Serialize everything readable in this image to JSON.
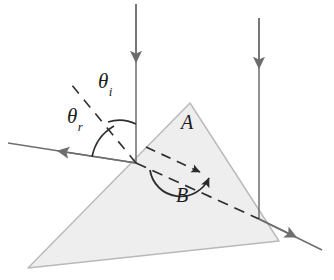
{
  "figure": {
    "background_color": "#ffffff",
    "prism": {
      "name": "triangular prism",
      "fill_color": "#eeeeee",
      "stroke_color": "#b4b4b4",
      "vertices": [
        {
          "label": "apex",
          "x": 190,
          "y": 103
        },
        {
          "label": "bottom-left",
          "x": 28,
          "y": 268
        },
        {
          "label": "bottom-right",
          "x": 279,
          "y": 241
        }
      ]
    },
    "labels": {
      "theta_incident": {
        "symbol": "θ",
        "subscript": "i"
      },
      "theta_refracted": {
        "symbol": "θ",
        "subscript": "r"
      },
      "region_a": "A",
      "region_b": "B"
    },
    "rays": [
      {
        "name": "incident-ray",
        "style": "solid",
        "color": "#6b6b6b",
        "from": {
          "x": 136,
          "y": 4
        },
        "to": {
          "x": 136,
          "y": 163
        },
        "arrowhead_at": {
          "x": 136,
          "y": 62
        },
        "direction": "downward"
      },
      {
        "name": "reflected-ray",
        "style": "solid",
        "color": "#6b6b6b",
        "from": {
          "x": 136,
          "y": 163
        },
        "to": {
          "x": 8,
          "y": 143
        },
        "arrowhead_at": {
          "x": 58,
          "y": 151
        },
        "direction": "up-left"
      },
      {
        "name": "secondary-incident-ray",
        "style": "solid",
        "color": "#6b6b6b",
        "from": {
          "x": 259,
          "y": 18
        },
        "to": {
          "x": 259,
          "y": 219
        },
        "arrowhead_at": {
          "x": 259,
          "y": 66
        },
        "direction": "downward"
      },
      {
        "name": "exit-ray",
        "style": "solid",
        "color": "#6b6b6b",
        "from": {
          "x": 259,
          "y": 219
        },
        "to": {
          "x": 322,
          "y": 250
        },
        "arrowhead_at": {
          "x": 294,
          "y": 236
        },
        "direction": "down-right"
      },
      {
        "name": "refracted-ray-internal",
        "style": "dashed",
        "color": "#2a2a2a",
        "from": {
          "x": 136,
          "y": 163
        },
        "to": {
          "x": 259,
          "y": 219
        }
      },
      {
        "name": "normal-extension-dashed",
        "style": "dashed",
        "color": "#2a2a2a",
        "from": {
          "x": 136,
          "y": 163
        },
        "to": {
          "x": 73,
          "y": 86
        }
      },
      {
        "name": "internal-dashed-upper",
        "style": "dashed",
        "color": "#2a2a2a",
        "from": {
          "x": 148,
          "y": 148
        },
        "to": {
          "x": 205,
          "y": 175
        }
      }
    ],
    "angle_arcs": [
      {
        "name": "theta-i-arc",
        "between": [
          "normal-extension-dashed",
          "incident-ray"
        ]
      },
      {
        "name": "theta-r-arc",
        "between": [
          "reflected-ray",
          "normal-extension-dashed"
        ]
      },
      {
        "name": "angle-b-arc",
        "double_headed": true,
        "region": "B"
      }
    ]
  }
}
